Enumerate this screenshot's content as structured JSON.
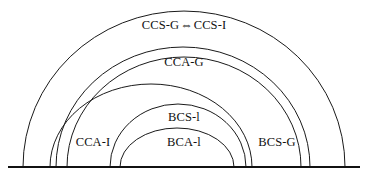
{
  "figure": {
    "type": "nested-semicircle-containment-diagram",
    "background_color": "#ffffff",
    "stroke_color": "#1a1a1a",
    "baseline_color": "#111111",
    "baseline_y": 167,
    "width": 367,
    "height": 181
  },
  "labels": {
    "outermost": {
      "left_text": "CCS-G",
      "arrow": "⇔",
      "right_text": "CCS-I",
      "full_text": "CCS-G ⇔ CCS-I"
    },
    "cca_g": "CCA-G",
    "cca_i": "CCA-I",
    "bcs_i": "BCS-l",
    "bca_i": "BCA-l",
    "bcs_g": "BCS-G"
  },
  "arcs": [
    {
      "name": "ccs-arc",
      "label_ref": "outermost",
      "center_x": 184,
      "radius_x": 161,
      "radius_y": 156,
      "left_foot_x": 23,
      "right_foot_x": 345,
      "apex_y": 11
    },
    {
      "name": "cca-g-arc",
      "label_ref": "cca_g",
      "center_x": 183,
      "radius_x": 127,
      "radius_y": 120,
      "left_foot_x": 56,
      "right_foot_x": 310,
      "apex_y": 47
    },
    {
      "name": "cca-i-arc",
      "label_ref": "cca_i",
      "center_x": 184,
      "radius_x": 117,
      "radius_y": 110,
      "left_foot_x": 67,
      "right_foot_x": 301,
      "apex_y": 57
    },
    {
      "name": "bcs-g-arc",
      "label_ref": "bcs_g",
      "center_x": 151,
      "radius_x": 101,
      "radius_y": 83,
      "left_foot_x": 50,
      "right_foot_x": 252,
      "apex_y": 84
    },
    {
      "name": "bcs-i-arc",
      "label_ref": "bcs_i",
      "center_x": 178,
      "radius_x": 68,
      "radius_y": 63,
      "left_foot_x": 110,
      "right_foot_x": 246,
      "apex_y": 104
    },
    {
      "name": "bca-i-arc",
      "label_ref": "bca_i",
      "center_x": 177,
      "radius_x": 57,
      "radius_y": 39,
      "left_foot_x": 120,
      "right_foot_x": 234,
      "apex_y": 128
    }
  ],
  "label_positions": {
    "outermost": {
      "x": 184,
      "y": 25
    },
    "cca_g": {
      "x": 184,
      "y": 62
    },
    "bcs_i": {
      "x": 184,
      "y": 117
    },
    "bca_i": {
      "x": 184,
      "y": 142
    },
    "cca_i": {
      "x": 93,
      "y": 142
    },
    "bcs_g": {
      "x": 277,
      "y": 142
    }
  }
}
